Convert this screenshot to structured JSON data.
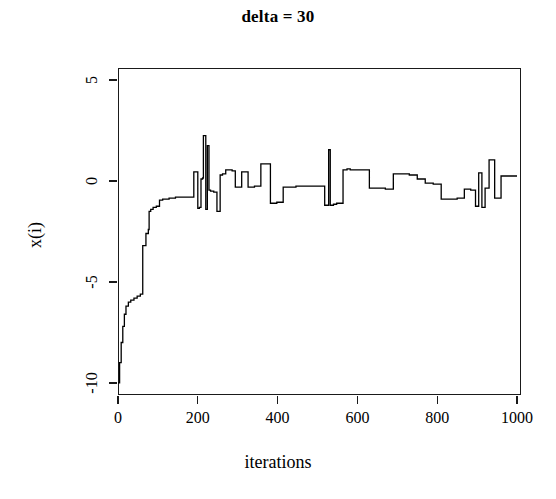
{
  "chart_data": {
    "type": "line",
    "title": "delta = 30",
    "xlabel": "iterations",
    "ylabel": "x(i)",
    "xlim": [
      0,
      1010
    ],
    "ylim": [
      -10.6,
      5.6
    ],
    "xticks": [
      0,
      200,
      400,
      600,
      800,
      1000
    ],
    "xtick_labels": [
      "0",
      "200",
      "400",
      "600",
      "800",
      "1000"
    ],
    "yticks": [
      5,
      0,
      -5,
      -10
    ],
    "ytick_labels": [
      "5",
      "0",
      "-5",
      "-10"
    ],
    "grid": false,
    "legend": null,
    "line_color": "#000000",
    "line_width": 1.3,
    "step_style": "post",
    "series_name": "x(i)",
    "x": [
      0,
      4,
      8,
      12,
      16,
      20,
      26,
      32,
      40,
      48,
      56,
      62,
      70,
      76,
      78,
      82,
      88,
      96,
      104,
      112,
      120,
      128,
      136,
      144,
      152,
      160,
      166,
      172,
      178,
      184,
      190,
      196,
      200,
      204,
      208,
      212,
      214,
      218,
      220,
      222,
      224,
      226,
      228,
      230,
      232,
      234,
      236,
      238,
      240,
      244,
      248,
      252,
      256,
      258,
      262,
      266,
      270,
      274,
      278,
      282,
      286,
      290,
      294,
      298,
      302,
      306,
      310,
      318,
      326,
      334,
      342,
      350,
      358,
      366,
      374,
      382,
      390,
      398,
      406,
      414,
      422,
      430,
      438,
      446,
      454,
      462,
      470,
      478,
      486,
      494,
      502,
      510,
      518,
      524,
      528,
      530,
      532,
      536,
      540,
      548,
      556,
      564,
      570,
      574,
      578,
      582,
      590,
      598,
      606,
      614,
      622,
      630,
      640,
      650,
      660,
      670,
      680,
      690,
      700,
      710,
      720,
      730,
      740,
      750,
      760,
      770,
      780,
      790,
      800,
      810,
      820,
      830,
      840,
      850,
      860,
      868,
      876,
      884,
      890,
      896,
      900,
      904,
      908,
      912,
      916,
      920,
      924,
      930,
      936,
      944,
      952,
      960,
      968,
      976,
      984,
      992,
      1000
    ],
    "y": [
      -10.0,
      -9.0,
      -8.0,
      -7.2,
      -6.6,
      -6.2,
      -6.0,
      -5.9,
      -5.8,
      -5.7,
      -5.6,
      -3.2,
      -2.6,
      -2.4,
      -1.5,
      -1.4,
      -1.3,
      -1.25,
      -0.95,
      -0.9,
      -0.9,
      -0.85,
      -0.85,
      -0.8,
      -0.8,
      -0.8,
      -0.8,
      -0.8,
      -0.8,
      -0.8,
      0.45,
      0.45,
      -1.35,
      -1.3,
      0.1,
      0.15,
      2.25,
      2.25,
      -1.4,
      -1.4,
      1.75,
      1.75,
      -0.45,
      -0.45,
      -0.5,
      -0.5,
      -0.5,
      -0.5,
      -0.55,
      -0.55,
      -1.5,
      -1.5,
      0.3,
      0.3,
      0.35,
      0.35,
      0.55,
      0.55,
      0.55,
      0.55,
      0.5,
      0.5,
      -0.3,
      -0.3,
      -0.3,
      -0.3,
      0.45,
      0.45,
      -0.3,
      -0.3,
      -0.25,
      -0.25,
      0.85,
      0.85,
      0.85,
      -1.1,
      -1.1,
      -1.05,
      -1.05,
      -0.3,
      -0.3,
      -0.3,
      -0.3,
      -0.25,
      -0.25,
      -0.25,
      -0.25,
      -0.25,
      -0.25,
      -0.25,
      -0.25,
      -0.25,
      -1.2,
      -1.2,
      1.55,
      1.55,
      -1.2,
      -1.2,
      -1.15,
      -1.1,
      -1.1,
      0.55,
      0.55,
      0.6,
      0.6,
      0.55,
      0.55,
      0.55,
      0.55,
      0.55,
      0.55,
      -0.35,
      -0.35,
      -0.35,
      -0.35,
      -0.4,
      -0.4,
      0.35,
      0.35,
      0.35,
      0.35,
      0.3,
      0.3,
      0.1,
      0.1,
      -0.1,
      -0.1,
      -0.15,
      -0.15,
      -0.9,
      -0.9,
      -0.9,
      -0.9,
      -0.85,
      -0.85,
      -0.4,
      -0.4,
      -0.45,
      -0.45,
      -1.25,
      -1.25,
      0.4,
      0.4,
      -1.3,
      -1.3,
      -0.35,
      -0.35,
      1.05,
      1.05,
      -0.85,
      -0.85,
      0.25,
      0.25,
      0.25,
      0.25,
      0.25
    ]
  }
}
